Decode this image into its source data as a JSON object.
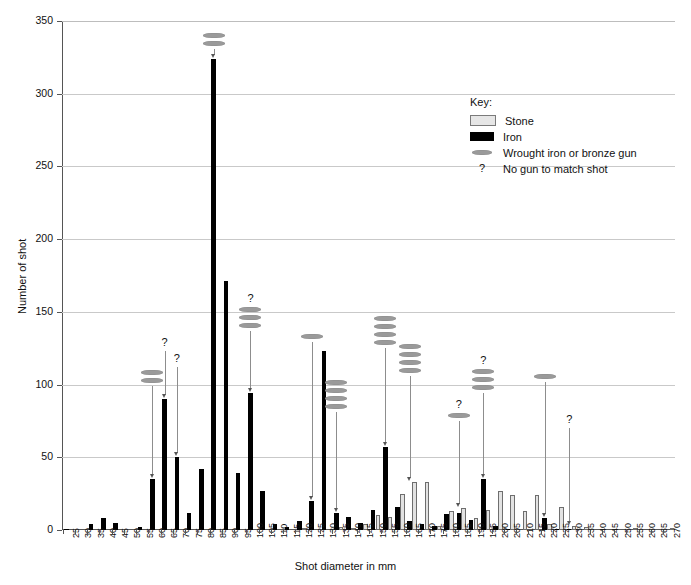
{
  "chart_data": {
    "type": "bar",
    "title": "",
    "xlabel": "Shot diameter in mm",
    "ylabel": "Number of shot",
    "ylim": [
      0,
      350
    ],
    "ytick_step": 50,
    "yticks": [
      0,
      50,
      100,
      150,
      200,
      250,
      300,
      350
    ],
    "grid": "horizontal",
    "legend_position": "upper-right-inside",
    "categories": [
      25,
      30,
      35,
      40,
      45,
      50,
      55,
      60,
      65,
      70,
      75,
      80,
      85,
      90,
      95,
      100,
      105,
      110,
      115,
      120,
      125,
      130,
      135,
      140,
      145,
      150,
      155,
      160,
      165,
      170,
      175,
      180,
      185,
      190,
      195,
      200,
      205,
      210,
      215,
      220,
      225,
      230,
      235,
      240,
      245,
      250,
      255,
      260,
      265,
      270
    ],
    "series": [
      {
        "name": "Iron",
        "color": "#000000",
        "values": [
          1,
          0,
          4,
          8,
          5,
          0,
          2,
          35,
          90,
          50,
          12,
          42,
          324,
          171,
          39,
          94,
          27,
          4,
          2,
          6,
          20,
          123,
          12,
          9,
          5,
          14,
          57,
          16,
          6,
          4,
          3,
          11,
          12,
          7,
          35,
          3,
          1,
          0,
          0,
          8,
          1,
          1,
          0,
          0,
          0,
          0,
          0,
          0,
          0,
          0
        ]
      },
      {
        "name": "Stone",
        "color": "#e2e2e2",
        "values": [
          0,
          0,
          0,
          0,
          0,
          0,
          0,
          0,
          0,
          0,
          0,
          0,
          0,
          0,
          0,
          0,
          0,
          0,
          0,
          1,
          0,
          0,
          2,
          1,
          4,
          10,
          9,
          25,
          33,
          33,
          3,
          13,
          15,
          8,
          14,
          27,
          24,
          13,
          24,
          4,
          16,
          3,
          2,
          0,
          0,
          0,
          1,
          0,
          0,
          1
        ]
      }
    ],
    "markers": {
      "name": "Wrought iron or bronze gun",
      "color": "#9a9a9a",
      "groups": [
        {
          "category": 60,
          "guns": 2,
          "question": false,
          "top": 110
        },
        {
          "category": 65,
          "guns": 0,
          "question": true,
          "top": 133
        },
        {
          "category": 70,
          "guns": 0,
          "question": true,
          "top": 122
        },
        {
          "category": 85,
          "guns": 2,
          "question": false,
          "top": 342
        },
        {
          "category": 100,
          "guns": 3,
          "question": true,
          "top": 163
        },
        {
          "category": 125,
          "guns": 1,
          "question": false,
          "top": 135
        },
        {
          "category": 135,
          "guns": 4,
          "question": false,
          "top": 103
        },
        {
          "category": 155,
          "guns": 4,
          "question": false,
          "top": 147
        },
        {
          "category": 165,
          "guns": 4,
          "question": false,
          "top": 128
        },
        {
          "category": 185,
          "guns": 1,
          "question": true,
          "top": 90
        },
        {
          "category": 195,
          "guns": 3,
          "question": true,
          "top": 120
        },
        {
          "category": 220,
          "guns": 1,
          "question": false,
          "top": 107
        },
        {
          "category": 230,
          "guns": 0,
          "question": true,
          "top": 80
        }
      ]
    }
  },
  "legend": {
    "title": "Key:",
    "items": [
      {
        "label": "Stone",
        "swatch": "stone-swatch"
      },
      {
        "label": "Iron",
        "swatch": "iron-swatch"
      },
      {
        "label": "Wrought iron or bronze gun",
        "swatch": "gun-swatch"
      },
      {
        "label": "No gun to match shot",
        "swatch": "question-mark"
      }
    ],
    "question_glyph": "?"
  }
}
